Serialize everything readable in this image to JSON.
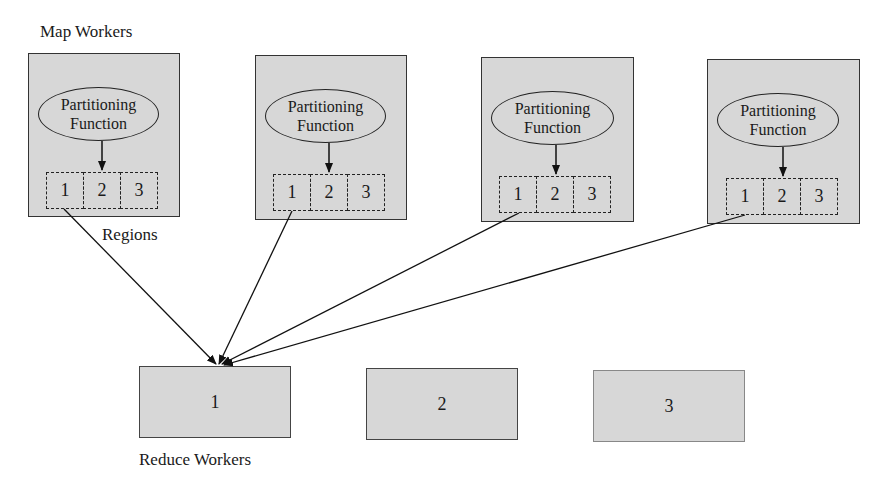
{
  "labels": {
    "map_workers": "Map Workers",
    "regions": "Regions",
    "reduce_workers": "Reduce Workers"
  },
  "map_workers": [
    {
      "partition_label_line1": "Partitioning",
      "partition_label_line2": "Function",
      "regions": [
        "1",
        "2",
        "3"
      ]
    },
    {
      "partition_label_line1": "Partitioning",
      "partition_label_line2": "Function",
      "regions": [
        "1",
        "2",
        "3"
      ]
    },
    {
      "partition_label_line1": "Partitioning",
      "partition_label_line2": "Function",
      "regions": [
        "1",
        "2",
        "3"
      ]
    },
    {
      "partition_label_line1": "Partitioning",
      "partition_label_line2": "Function",
      "regions": [
        "1",
        "2",
        "3"
      ]
    }
  ],
  "reduce_workers": [
    {
      "label": "1"
    },
    {
      "label": "2"
    },
    {
      "label": "3"
    }
  ],
  "edges": [
    {
      "from": "map_worker_1.region_1",
      "to": "reduce_worker_1"
    },
    {
      "from": "map_worker_2.region_1",
      "to": "reduce_worker_1"
    },
    {
      "from": "map_worker_3.region_1",
      "to": "reduce_worker_1"
    },
    {
      "from": "map_worker_4.region_1",
      "to": "reduce_worker_1"
    }
  ],
  "colors": {
    "box_fill": "#d7d7d7",
    "stroke": "#222222"
  }
}
